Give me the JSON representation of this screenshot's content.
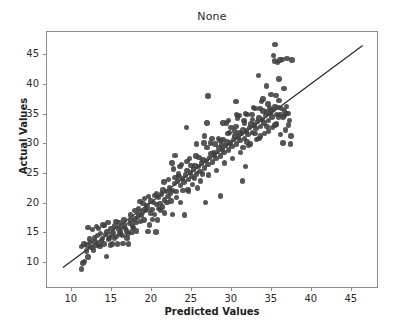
{
  "chart_data": {
    "type": "scatter",
    "title": "None",
    "xlabel": "Predicted Values",
    "ylabel": "Actual Values",
    "xlim": [
      6.9,
      48.4
    ],
    "ylim": [
      5.6,
      48.9
    ],
    "xticks": [
      10,
      15,
      20,
      25,
      30,
      35,
      40,
      45
    ],
    "yticks": [
      10,
      15,
      20,
      25,
      30,
      35,
      40,
      45
    ],
    "xticklabels": [
      "10",
      "15",
      "20",
      "25",
      "30",
      "35",
      "40",
      "45"
    ],
    "yticklabels": [
      "10",
      "15",
      "20",
      "25",
      "30",
      "35",
      "40",
      "45"
    ],
    "grid": false,
    "legend": null,
    "marker_color": "#3f3f3f",
    "marker_size": 5.4,
    "reference_line": {
      "name": "identity-line",
      "color": "#262626",
      "x": [
        8.9,
        46.6
      ],
      "y": [
        8.9,
        46.6
      ]
    },
    "series": [
      {
        "name": "predicted-vs-actual",
        "points": [
          [
            11.2,
            9.0
          ],
          [
            11.4,
            10.0
          ],
          [
            11.6,
            10.2
          ],
          [
            11.2,
            12.8
          ],
          [
            11.5,
            13.2
          ],
          [
            12.0,
            11.0
          ],
          [
            12.3,
            13.4
          ],
          [
            12.0,
            16.0
          ],
          [
            12.6,
            15.6
          ],
          [
            12.8,
            14.2
          ],
          [
            12.4,
            12.6
          ],
          [
            13.0,
            12.9
          ],
          [
            13.2,
            14.6
          ],
          [
            13.4,
            13.1
          ],
          [
            13.1,
            16.1
          ],
          [
            13.6,
            15.0
          ],
          [
            13.8,
            14.1
          ],
          [
            13.5,
            12.8
          ],
          [
            14.0,
            13.2
          ],
          [
            14.2,
            14.8
          ],
          [
            14.4,
            15.3
          ],
          [
            14.1,
            16.3
          ],
          [
            14.6,
            14.0
          ],
          [
            14.3,
            11.1
          ],
          [
            14.8,
            13.0
          ],
          [
            15.0,
            14.6
          ],
          [
            15.2,
            15.1
          ],
          [
            15.4,
            16.2
          ],
          [
            15.1,
            13.2
          ],
          [
            15.6,
            14.4
          ],
          [
            15.8,
            15.7
          ],
          [
            15.5,
            17.0
          ],
          [
            16.0,
            14.9
          ],
          [
            16.2,
            16.0
          ],
          [
            16.4,
            13.3
          ],
          [
            16.1,
            15.2
          ],
          [
            16.6,
            16.4
          ],
          [
            16.8,
            15.4
          ],
          [
            16.5,
            17.2
          ],
          [
            17.0,
            15.0
          ],
          [
            17.2,
            16.6
          ],
          [
            17.4,
            17.1
          ],
          [
            17.1,
            13.2
          ],
          [
            17.6,
            16.2
          ],
          [
            17.8,
            17.4
          ],
          [
            17.5,
            15.2
          ],
          [
            18.0,
            16.8
          ],
          [
            18.2,
            17.6
          ],
          [
            18.4,
            18.2
          ],
          [
            18.1,
            15.4
          ],
          [
            18.6,
            17.0
          ],
          [
            18.8,
            18.6
          ],
          [
            18.5,
            20.3
          ],
          [
            19.0,
            17.2
          ],
          [
            19.2,
            18.8
          ],
          [
            19.4,
            19.6
          ],
          [
            19.1,
            20.8
          ],
          [
            19.6,
            21.2
          ],
          [
            19.8,
            18.4
          ],
          [
            19.5,
            15.3
          ],
          [
            20.0,
            19.0
          ],
          [
            20.2,
            20.2
          ],
          [
            20.4,
            21.4
          ],
          [
            20.1,
            17.3
          ],
          [
            20.6,
            19.8
          ],
          [
            20.8,
            21.0
          ],
          [
            20.5,
            15.2
          ],
          [
            21.0,
            20.0
          ],
          [
            21.2,
            21.6
          ],
          [
            21.4,
            22.3
          ],
          [
            21.1,
            18.9
          ],
          [
            21.6,
            20.6
          ],
          [
            21.8,
            22.0
          ],
          [
            21.5,
            23.6
          ],
          [
            22.0,
            21.2
          ],
          [
            22.2,
            22.6
          ],
          [
            22.4,
            20.4
          ],
          [
            22.1,
            24.0
          ],
          [
            22.6,
            22.2
          ],
          [
            22.8,
            23.4
          ],
          [
            22.5,
            26.8
          ],
          [
            22.9,
            28.1
          ],
          [
            23.0,
            22.0
          ],
          [
            23.2,
            23.8
          ],
          [
            23.4,
            24.6
          ],
          [
            23.1,
            21.0
          ],
          [
            23.6,
            23.0
          ],
          [
            23.8,
            24.2
          ],
          [
            23.5,
            26.2
          ],
          [
            24.0,
            23.6
          ],
          [
            24.2,
            24.8
          ],
          [
            24.4,
            25.6
          ],
          [
            24.1,
            18.1
          ],
          [
            24.6,
            24.0
          ],
          [
            24.8,
            25.2
          ],
          [
            24.5,
            22.4
          ],
          [
            24.3,
            32.8
          ],
          [
            25.0,
            24.6
          ],
          [
            25.2,
            25.8
          ],
          [
            25.4,
            26.4
          ],
          [
            25.1,
            23.2
          ],
          [
            25.6,
            25.0
          ],
          [
            25.8,
            26.2
          ],
          [
            25.5,
            28.0
          ],
          [
            26.0,
            25.4
          ],
          [
            26.2,
            26.8
          ],
          [
            26.4,
            27.4
          ],
          [
            26.1,
            23.8
          ],
          [
            26.6,
            26.0
          ],
          [
            26.8,
            27.2
          ],
          [
            26.5,
            30.2
          ],
          [
            26.9,
            33.6
          ],
          [
            27.0,
            26.6
          ],
          [
            27.2,
            27.8
          ],
          [
            27.4,
            28.4
          ],
          [
            27.1,
            24.8
          ],
          [
            27.6,
            27.0
          ],
          [
            27.8,
            28.2
          ],
          [
            27.5,
            31.0
          ],
          [
            27.0,
            38.1
          ],
          [
            28.0,
            27.6
          ],
          [
            28.2,
            28.8
          ],
          [
            28.4,
            29.4
          ],
          [
            28.1,
            25.6
          ],
          [
            28.6,
            28.0
          ],
          [
            28.8,
            29.2
          ],
          [
            28.5,
            30.6
          ],
          [
            28.9,
            33.6
          ],
          [
            29.0,
            28.6
          ],
          [
            29.2,
            29.8
          ],
          [
            29.4,
            30.4
          ],
          [
            29.1,
            26.8
          ],
          [
            29.6,
            29.0
          ],
          [
            29.8,
            30.2
          ],
          [
            29.5,
            31.8
          ],
          [
            28.6,
            21.3
          ],
          [
            30.0,
            29.6
          ],
          [
            30.2,
            30.8
          ],
          [
            30.4,
            31.4
          ],
          [
            30.1,
            27.6
          ],
          [
            30.6,
            30.0
          ],
          [
            30.8,
            31.2
          ],
          [
            30.5,
            33.0
          ],
          [
            30.9,
            34.8
          ],
          [
            31.0,
            30.6
          ],
          [
            31.2,
            31.8
          ],
          [
            31.4,
            32.4
          ],
          [
            31.1,
            28.6
          ],
          [
            31.6,
            31.0
          ],
          [
            31.8,
            32.2
          ],
          [
            31.5,
            34.0
          ],
          [
            31.9,
            35.0
          ],
          [
            31.3,
            23.8
          ],
          [
            31.7,
            26.2
          ],
          [
            32.0,
            31.6
          ],
          [
            32.2,
            32.8
          ],
          [
            32.4,
            33.4
          ],
          [
            32.1,
            29.8
          ],
          [
            32.6,
            32.0
          ],
          [
            32.8,
            33.2
          ],
          [
            32.5,
            35.0
          ],
          [
            32.9,
            36.0
          ],
          [
            30.5,
            37.2
          ],
          [
            33.0,
            32.6
          ],
          [
            33.2,
            33.8
          ],
          [
            33.4,
            34.4
          ],
          [
            33.1,
            30.8
          ],
          [
            33.6,
            33.0
          ],
          [
            33.8,
            34.2
          ],
          [
            33.5,
            36.0
          ],
          [
            33.9,
            37.6
          ],
          [
            33.3,
            41.6
          ],
          [
            34.0,
            33.6
          ],
          [
            34.2,
            34.8
          ],
          [
            34.4,
            35.4
          ],
          [
            34.1,
            31.8
          ],
          [
            34.6,
            34.0
          ],
          [
            34.8,
            35.2
          ],
          [
            34.5,
            36.8
          ],
          [
            34.9,
            38.4
          ],
          [
            34.3,
            39.8
          ],
          [
            35.0,
            34.6
          ],
          [
            35.2,
            35.8
          ],
          [
            35.4,
            36.4
          ],
          [
            35.1,
            32.8
          ],
          [
            35.6,
            35.0
          ],
          [
            35.8,
            36.2
          ],
          [
            35.5,
            38.2
          ],
          [
            35.9,
            41.0
          ],
          [
            35.3,
            44.0
          ],
          [
            35.4,
            46.8
          ],
          [
            35.2,
            44.9
          ],
          [
            35.7,
            43.8
          ],
          [
            36.0,
            35.0
          ],
          [
            36.2,
            36.0
          ],
          [
            36.4,
            34.6
          ],
          [
            36.1,
            31.6
          ],
          [
            36.6,
            35.6
          ],
          [
            36.8,
            36.4
          ],
          [
            36.5,
            39.4
          ],
          [
            36.9,
            44.4
          ],
          [
            36.3,
            44.3
          ],
          [
            36.7,
            32.4
          ],
          [
            37.0,
            35.2
          ],
          [
            37.2,
            34.0
          ],
          [
            37.4,
            31.4
          ],
          [
            37.1,
            33.2
          ],
          [
            37.3,
            30.0
          ],
          [
            36.0,
            44.2
          ],
          [
            37.5,
            44.2
          ],
          [
            12.2,
            14.0
          ],
          [
            13.3,
            15.8
          ],
          [
            14.5,
            16.8
          ],
          [
            15.3,
            14.1
          ],
          [
            16.3,
            14.6
          ],
          [
            17.3,
            18.1
          ],
          [
            18.3,
            19.2
          ],
          [
            19.3,
            19.0
          ],
          [
            20.3,
            18.2
          ],
          [
            21.3,
            19.4
          ],
          [
            22.3,
            21.8
          ],
          [
            23.3,
            25.0
          ],
          [
            24.4,
            27.1
          ],
          [
            25.3,
            24.2
          ],
          [
            26.3,
            25.0
          ],
          [
            27.3,
            30.2
          ],
          [
            28.3,
            31.0
          ],
          [
            29.3,
            33.6
          ],
          [
            30.3,
            32.2
          ],
          [
            31.4,
            29.4
          ],
          [
            32.3,
            30.0
          ],
          [
            33.4,
            31.0
          ],
          [
            34.4,
            33.0
          ],
          [
            35.4,
            33.2
          ],
          [
            36.4,
            30.2
          ],
          [
            11.8,
            12.0
          ],
          [
            12.9,
            13.6
          ],
          [
            13.9,
            16.4
          ],
          [
            14.9,
            15.8
          ],
          [
            15.9,
            16.8
          ],
          [
            16.9,
            14.2
          ],
          [
            17.9,
            18.8
          ],
          [
            18.9,
            20.0
          ],
          [
            19.9,
            20.4
          ],
          [
            20.9,
            19.2
          ],
          [
            21.9,
            20.2
          ],
          [
            22.9,
            24.4
          ],
          [
            23.9,
            22.2
          ],
          [
            24.9,
            26.4
          ],
          [
            25.9,
            27.8
          ],
          [
            26.9,
            29.4
          ],
          [
            27.9,
            30.0
          ],
          [
            28.9,
            30.8
          ],
          [
            29.9,
            32.8
          ],
          [
            30.9,
            32.0
          ],
          [
            31.9,
            30.4
          ],
          [
            32.9,
            31.8
          ],
          [
            33.9,
            35.6
          ],
          [
            34.9,
            35.6
          ],
          [
            35.9,
            37.4
          ],
          [
            22.7,
            25.8
          ],
          [
            23.7,
            26.6
          ],
          [
            24.7,
            27.6
          ],
          [
            25.7,
            22.6
          ],
          [
            26.7,
            20.2
          ],
          [
            19.7,
            16.4
          ],
          [
            20.7,
            17.2
          ],
          [
            18.7,
            18.0
          ],
          [
            17.7,
            16.0
          ],
          [
            16.7,
            15.8
          ],
          [
            13.7,
            13.8
          ],
          [
            12.7,
            12.2
          ],
          [
            14.7,
            14.2
          ],
          [
            15.7,
            13.2
          ],
          [
            11.9,
            13.0
          ],
          [
            30.7,
            34.4
          ],
          [
            31.7,
            35.2
          ],
          [
            32.7,
            36.2
          ],
          [
            33.7,
            37.2
          ],
          [
            34.7,
            36.2
          ],
          [
            29.7,
            32.0
          ],
          [
            28.7,
            30.0
          ],
          [
            27.7,
            28.6
          ],
          [
            26.6,
            31.4
          ],
          [
            25.6,
            30.0
          ],
          [
            24.6,
            22.0
          ],
          [
            23.6,
            20.2
          ],
          [
            21.6,
            18.4
          ],
          [
            22.6,
            18.2
          ],
          [
            20.6,
            21.6
          ],
          [
            36.6,
            34.8
          ],
          [
            36.8,
            35.2
          ],
          [
            35.8,
            34.6
          ],
          [
            35.6,
            33.4
          ],
          [
            34.6,
            32.2
          ],
          [
            33.6,
            31.4
          ],
          [
            32.6,
            34.2
          ],
          [
            31.6,
            33.6
          ],
          [
            30.6,
            35.0
          ],
          [
            29.6,
            34.0
          ]
        ]
      }
    ]
  },
  "footer": {
    "clipped_text": ""
  }
}
